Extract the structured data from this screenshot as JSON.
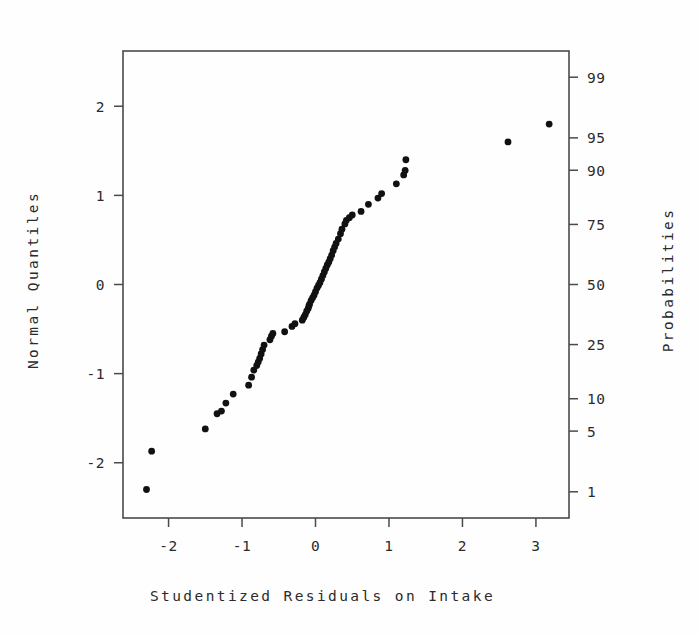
{
  "figure": {
    "background_color": "#fefefe",
    "foreground_color": "#2b2b2b",
    "point_color": "#111111"
  },
  "titles": {
    "x_axis": "Studentized Residuals on Intake",
    "y_axis_left": "Normal Quantiles",
    "y_axis_right": "Probabilities"
  },
  "chart_data": {
    "type": "scatter",
    "title": "",
    "subtitle": "",
    "xlabel": "Studentized Residuals on Intake",
    "ylabel": "Normal Quantiles",
    "y2label": "Probabilities",
    "xlim": [
      -2.62,
      3.45
    ],
    "ylim": [
      -2.62,
      2.62
    ],
    "grid": false,
    "legend": "none",
    "xticks": [
      -2,
      -1,
      0,
      1,
      2,
      3
    ],
    "xticklabels": [
      "-2",
      "-1",
      "0",
      "1",
      "2",
      "3"
    ],
    "yticks": [
      -2,
      -1,
      0,
      1,
      2
    ],
    "yticklabels": [
      "-2",
      "-1",
      "0",
      "1",
      "2"
    ],
    "y2ticks_probability": [
      1,
      5,
      10,
      25,
      50,
      75,
      90,
      95,
      99
    ],
    "y2ticklabels": [
      "1",
      "5",
      "10",
      "25",
      "50",
      "75",
      "90",
      "95",
      "99"
    ],
    "y2ticks_quantile": [
      -2.326,
      -1.645,
      -1.282,
      -0.674,
      0.0,
      0.674,
      1.282,
      1.645,
      2.326
    ],
    "series": [
      {
        "name": "studentized residuals",
        "n_points": 64,
        "x": [
          -2.3,
          -2.23,
          -1.5,
          -1.34,
          -1.28,
          -1.22,
          -1.12,
          -0.91,
          -0.87,
          -0.84,
          -0.8,
          -0.78,
          -0.76,
          -0.74,
          -0.72,
          -0.7,
          -0.62,
          -0.6,
          -0.58,
          -0.42,
          -0.32,
          -0.28,
          -0.18,
          -0.16,
          -0.14,
          -0.12,
          -0.1,
          -0.09,
          -0.08,
          -0.06,
          -0.04,
          -0.02,
          0.0,
          0.02,
          0.04,
          0.06,
          0.08,
          0.1,
          0.12,
          0.14,
          0.16,
          0.18,
          0.2,
          0.22,
          0.24,
          0.26,
          0.28,
          0.31,
          0.34,
          0.36,
          0.4,
          0.42,
          0.46,
          0.5,
          0.62,
          0.72,
          0.85,
          0.9,
          1.1,
          1.2,
          1.22,
          1.23,
          2.62,
          3.18
        ],
        "y": [
          -2.3,
          -1.87,
          -1.62,
          -1.45,
          -1.42,
          -1.33,
          -1.23,
          -1.13,
          -1.04,
          -0.96,
          -0.91,
          -0.87,
          -0.83,
          -0.78,
          -0.73,
          -0.68,
          -0.62,
          -0.58,
          -0.55,
          -0.53,
          -0.47,
          -0.44,
          -0.4,
          -0.37,
          -0.34,
          -0.3,
          -0.27,
          -0.24,
          -0.22,
          -0.18,
          -0.15,
          -0.12,
          -0.08,
          -0.04,
          -0.01,
          0.02,
          0.06,
          0.1,
          0.14,
          0.18,
          0.22,
          0.25,
          0.29,
          0.33,
          0.38,
          0.42,
          0.46,
          0.51,
          0.57,
          0.62,
          0.68,
          0.72,
          0.75,
          0.78,
          0.82,
          0.9,
          0.97,
          1.02,
          1.13,
          1.23,
          1.28,
          1.4,
          1.6,
          1.8
        ]
      }
    ],
    "outliers_note": "two high points near x=2.62 and x=3.18"
  }
}
